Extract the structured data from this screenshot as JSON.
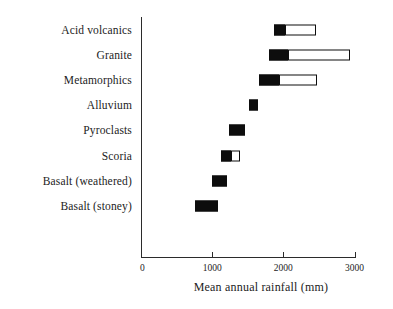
{
  "chart_data": {
    "type": "bar",
    "title": "",
    "subtitle": "",
    "xlabel": "Mean annual rainfall (mm)",
    "ylabel": "",
    "xlim": [
      0,
      3000
    ],
    "xticks": [
      0,
      1000,
      2000,
      3000
    ],
    "xtick_labels": [
      "0",
      "1000",
      "2000",
      "3000"
    ],
    "grid": false,
    "legend": "none",
    "orientation": "horizontal",
    "note": "Each row is a floating range bar: a solid black segment (core/common range) optionally extended by an open white-filled segment (full observed range).",
    "categories": [
      "Acid volcanics",
      "Granite",
      "Metamorphics",
      "Alluvium",
      "Pyroclasts",
      "Scoria",
      "Basalt (weathered)",
      "Basalt (stoney)"
    ],
    "series": [
      {
        "name": "solid range",
        "ranges": [
          [
            1870,
            2030
          ],
          [
            1800,
            2070
          ],
          [
            1660,
            1940
          ],
          [
            1520,
            1650
          ],
          [
            1240,
            1465
          ],
          [
            1125,
            1265
          ],
          [
            1000,
            1210
          ],
          [
            760,
            1085
          ]
        ]
      },
      {
        "name": "open range",
        "ranges": [
          [
            2030,
            2465
          ],
          [
            2070,
            2940
          ],
          [
            1940,
            2475
          ],
          null,
          null,
          [
            1265,
            1395
          ],
          null,
          null
        ]
      }
    ],
    "colors": {
      "solid_fill": "#0d0d0d",
      "open_fill": "#ffffff",
      "outline": "#0d0d0d",
      "axis": "#2b2b2b",
      "text": "#1c1c1c",
      "background": "#ffffff"
    }
  }
}
